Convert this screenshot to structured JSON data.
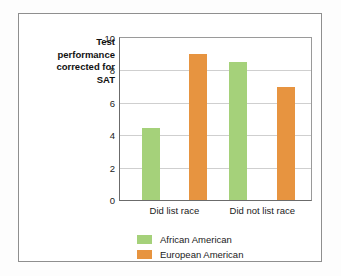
{
  "chart_data": {
    "type": "bar",
    "title": "",
    "xlabel": "",
    "ylabel": "Test performance corrected for SAT",
    "ylim": [
      0,
      10
    ],
    "yticks": [
      0,
      2,
      4,
      6,
      8,
      10
    ],
    "ytick_labels": [
      "0",
      "2",
      "4",
      "6",
      "8",
      "10"
    ],
    "grid": true,
    "legend_position": "bottom-left",
    "categories": [
      "Did list race",
      "Did not list race"
    ],
    "series": [
      {
        "name": "African American",
        "color": "#a5d17a",
        "values": [
          4.45,
          8.5
        ]
      },
      {
        "name": "European American",
        "color": "#e79440",
        "values": [
          9.0,
          7.0
        ]
      }
    ]
  },
  "figure": {
    "axis_title_text": "Test\nperformance\ncorrected for\nSAT",
    "border_color": "#8f8f8f",
    "background": "#ffffff"
  }
}
